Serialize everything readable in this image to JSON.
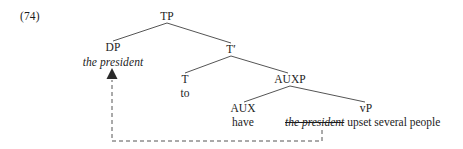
{
  "figure": {
    "example_number": "(74)",
    "type": "syntax-tree",
    "caption": ""
  },
  "colors": {
    "background": "#ffffff",
    "text": "#1c1c1c",
    "branch_line": "#555555",
    "movement_line": "#555555"
  },
  "tree": {
    "nodes": {
      "tp": {
        "label": "TP",
        "x": 167,
        "y": 16
      },
      "dp": {
        "label": "DP",
        "x": 113,
        "y": 47
      },
      "tbar": {
        "label": "T′",
        "x": 231,
        "y": 49
      },
      "t": {
        "label": "T",
        "x": 185,
        "y": 79
      },
      "auxp": {
        "label": "AUXP",
        "x": 290,
        "y": 79
      },
      "aux": {
        "label": "AUX",
        "x": 243,
        "y": 108
      },
      "vp": {
        "label": "vP",
        "x": 366,
        "y": 108
      }
    },
    "terminals": {
      "dp_spec": {
        "text": "the president",
        "style": "italic",
        "x": 113,
        "y": 62
      },
      "t_head": {
        "text": "to",
        "style": "plain",
        "x": 185,
        "y": 93
      },
      "aux_head": {
        "text": "have",
        "style": "plain",
        "x": 243,
        "y": 122
      },
      "vp_trace": {
        "text": "the president",
        "style": "italic-strikethrough",
        "x": 285,
        "y": 122
      },
      "vp_rest": {
        "text": " upset several people",
        "style": "plain"
      }
    },
    "branches": [
      {
        "name": "tp-to-dp",
        "from": [
          167,
          23
        ],
        "to": [
          113,
          41
        ]
      },
      {
        "name": "tp-to-tbar",
        "from": [
          167,
          23
        ],
        "to": [
          231,
          43
        ]
      },
      {
        "name": "tbar-to-t",
        "from": [
          231,
          56
        ],
        "to": [
          185,
          73
        ]
      },
      {
        "name": "tbar-to-auxp",
        "from": [
          231,
          56
        ],
        "to": [
          288,
          73
        ]
      },
      {
        "name": "auxp-to-aux",
        "from": [
          290,
          86
        ],
        "to": [
          244,
          102
        ]
      },
      {
        "name": "auxp-to-vp",
        "from": [
          290,
          86
        ],
        "to": [
          365,
          102
        ]
      }
    ],
    "movement_arrow": {
      "name": "dp-movement",
      "description": "dashed movement line from vP trace to DP specifier",
      "path": [
        [
          322,
          130
        ],
        [
          322,
          141
        ],
        [
          112,
          141
        ],
        [
          112,
          80
        ]
      ],
      "arrowhead_at": [
        112,
        70
      ],
      "style": "dashed"
    }
  }
}
